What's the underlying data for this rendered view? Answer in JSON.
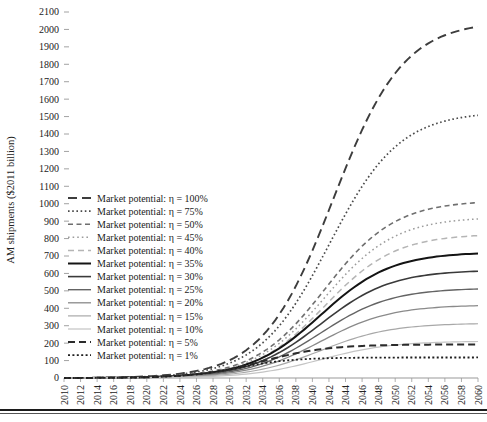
{
  "chart_data": {
    "type": "line",
    "title": "",
    "xlabel": "",
    "ylabel": "AM shipments ($2011 billion)",
    "xlim": [
      2010,
      2060
    ],
    "ylim": [
      0,
      2100
    ],
    "ytick_step": 100,
    "xtick_step": 2,
    "grid": false,
    "legend_position": "inside-left",
    "yticks": [
      "0",
      "100",
      "200",
      "300",
      "400",
      "500",
      "600",
      "700",
      "800",
      "900",
      "1000",
      "1100",
      "1200",
      "1300",
      "1400",
      "1500",
      "1600",
      "1700",
      "1800",
      "1900",
      "2000",
      "2100"
    ],
    "xticks": [
      "2010",
      "2012",
      "2014",
      "2016",
      "2018",
      "2020",
      "2022",
      "2024",
      "2026",
      "2028",
      "2030",
      "2032",
      "2034",
      "2036",
      "2038",
      "2040",
      "2042",
      "2044",
      "2046",
      "2048",
      "2050",
      "2052",
      "2054",
      "2056",
      "2058",
      "2060"
    ],
    "series": [
      {
        "name": "Market potential: η = 100%",
        "eta": 100,
        "plateau": 2050,
        "midpoint": 2042.5,
        "rate": 0.235,
        "color": "#3d3d3d",
        "width": 1.9,
        "dash": "9,5"
      },
      {
        "name": "Market potential: η = 75%",
        "eta": 75,
        "plateau": 1530,
        "midpoint": 2042.0,
        "rate": 0.235,
        "color": "#4a4a4a",
        "width": 1.7,
        "dash": "1.6,2.6"
      },
      {
        "name": "Market potential: η = 50%",
        "eta": 50,
        "plateau": 1020,
        "midpoint": 2041.5,
        "rate": 0.235,
        "color": "#6f6f6f",
        "width": 1.6,
        "dash": "5,3.5"
      },
      {
        "name": "Market potential: η = 45%",
        "eta": 45,
        "plateau": 925,
        "midpoint": 2041.5,
        "rate": 0.235,
        "color": "#9c9c9c",
        "width": 1.5,
        "dash": "1.6,3"
      },
      {
        "name": "Market potential: η = 40%",
        "eta": 40,
        "plateau": 828,
        "midpoint": 2041.5,
        "rate": 0.235,
        "color": "#b5b5b5",
        "width": 1.5,
        "dash": "6,4"
      },
      {
        "name": "Market potential: η = 35%",
        "eta": 35,
        "plateau": 723,
        "midpoint": 2041.0,
        "rate": 0.235,
        "color": "#141414",
        "width": 2.0,
        "dash": "none"
      },
      {
        "name": "Market potential: η = 30%",
        "eta": 30,
        "plateau": 620,
        "midpoint": 2041.0,
        "rate": 0.235,
        "color": "#3a3a3a",
        "width": 1.6,
        "dash": "none"
      },
      {
        "name": "Market potential: η = 25%",
        "eta": 25,
        "plateau": 517,
        "midpoint": 2041.0,
        "rate": 0.235,
        "color": "#646464",
        "width": 1.4,
        "dash": "none"
      },
      {
        "name": "Market potential: η = 20%",
        "eta": 20,
        "plateau": 420,
        "midpoint": 2041.0,
        "rate": 0.235,
        "color": "#8a8a8a",
        "width": 1.3,
        "dash": "none"
      },
      {
        "name": "Market potential: η = 15%",
        "eta": 15,
        "plateau": 315,
        "midpoint": 2041.0,
        "rate": 0.235,
        "color": "#a8a8a8",
        "width": 1.2,
        "dash": "none"
      },
      {
        "name": "Market potential: η = 10%",
        "eta": 10,
        "plateau": 212,
        "midpoint": 2041.0,
        "rate": 0.235,
        "color": "#c4c4c4",
        "width": 1.2,
        "dash": "none"
      },
      {
        "name": "Market potential: η = 5%",
        "eta": 5,
        "plateau": 193,
        "midpoint": 2034.0,
        "rate": 0.255,
        "color": "#2b2b2b",
        "width": 2.0,
        "dash": "7,4"
      },
      {
        "name": "Market potential: η = 1%",
        "eta": 1,
        "plateau": 118,
        "midpoint": 2031.0,
        "rate": 0.3,
        "color": "#1f1f1f",
        "width": 1.8,
        "dash": "2,2.4"
      }
    ]
  },
  "legend": {
    "items": [
      "Market potential: η = 100%",
      "Market potential: η = 75%",
      "Market potential: η = 50%",
      "Market potential: η = 45%",
      "Market potential: η = 40%",
      "Market potential: η = 35%",
      "Market potential: η = 30%",
      "Market potential: η = 25%",
      "Market potential: η = 20%",
      "Market potential: η = 15%",
      "Market potential: η = 10%",
      "Market potential: η = 5%",
      "Market potential: η = 1%"
    ]
  }
}
